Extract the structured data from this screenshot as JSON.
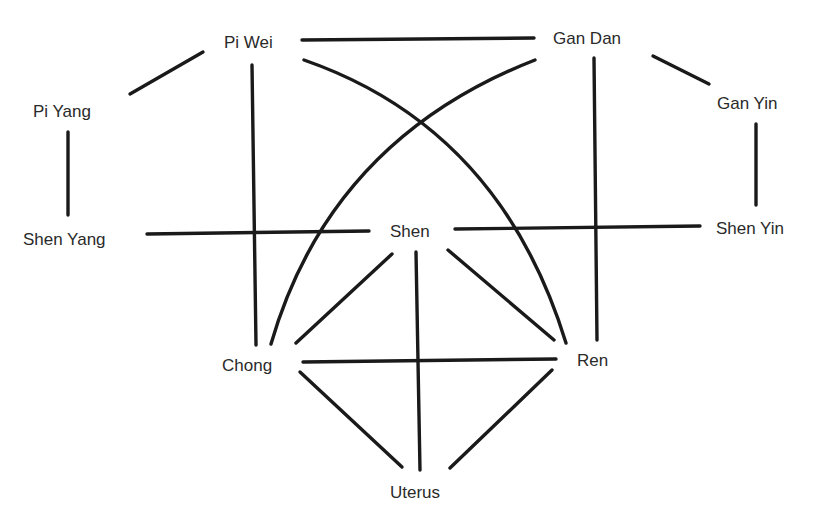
{
  "diagram": {
    "type": "network",
    "nodes": [
      {
        "id": "pi_wei",
        "label": "Pi Wei",
        "x": 224,
        "y": 34
      },
      {
        "id": "gan_dan",
        "label": "Gan Dan",
        "x": 553,
        "y": 30
      },
      {
        "id": "pi_yang",
        "label": "Pi Yang",
        "x": 33,
        "y": 103
      },
      {
        "id": "gan_yin",
        "label": "Gan Yin",
        "x": 717,
        "y": 95
      },
      {
        "id": "shen_yang",
        "label": "Shen Yang",
        "x": 23,
        "y": 231
      },
      {
        "id": "shen",
        "label": "Shen",
        "x": 390,
        "y": 223
      },
      {
        "id": "shen_yin",
        "label": "Shen Yin",
        "x": 716,
        "y": 220
      },
      {
        "id": "chong",
        "label": "Chong",
        "x": 222,
        "y": 357
      },
      {
        "id": "ren",
        "label": "Ren",
        "x": 577,
        "y": 352
      },
      {
        "id": "uterus",
        "label": "Uterus",
        "x": 390,
        "y": 484
      }
    ],
    "edges": [
      {
        "from": "pi_wei",
        "to": "gan_dan",
        "d": "M302 40 L534 38"
      },
      {
        "from": "pi_yang",
        "to": "pi_wei",
        "d": "M130 94 L203 52"
      },
      {
        "from": "gan_dan",
        "to": "gan_yin",
        "d": "M653 56 L709 84"
      },
      {
        "from": "pi_yang",
        "to": "shen_yang",
        "d": "M68 132 L68 215"
      },
      {
        "from": "gan_yin",
        "to": "shen_yin",
        "d": "M756 124 L756 205"
      },
      {
        "from": "pi_wei",
        "to": "chong",
        "d": "M252 65 L256 345"
      },
      {
        "from": "gan_dan",
        "to": "ren",
        "d": "M594 58 L597 340"
      },
      {
        "from": "shen_yang",
        "to": "shen",
        "d": "M147 234 L369 231"
      },
      {
        "from": "shen",
        "to": "shen_yin",
        "d": "M455 229 L700 226"
      },
      {
        "from": "pi_wei",
        "to": "ren",
        "d": "M304 60 Q500 128 566 343",
        "curved": true
      },
      {
        "from": "gan_dan",
        "to": "chong",
        "d": "M535 60 Q330 140 271 344",
        "curved": true
      },
      {
        "from": "shen",
        "to": "chong",
        "d": "M392 254 L296 343"
      },
      {
        "from": "shen",
        "to": "uterus",
        "d": "M416 252 L420 470"
      },
      {
        "from": "shen",
        "to": "ren",
        "d": "M448 250 L554 340"
      },
      {
        "from": "chong",
        "to": "ren",
        "d": "M303 362 L556 359"
      },
      {
        "from": "chong",
        "to": "uterus",
        "d": "M300 372 L402 467"
      },
      {
        "from": "ren",
        "to": "uterus",
        "d": "M552 370 L450 468"
      }
    ],
    "colors": {
      "line": "#1a1a1a",
      "text": "#2a2a2a",
      "background": "#ffffff"
    }
  }
}
